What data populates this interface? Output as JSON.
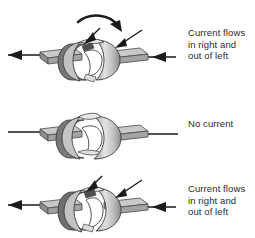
{
  "diagram": {
    "colors": {
      "ink": "#1a1a1a",
      "text": "#2b2b2b",
      "background": "#ffffff",
      "metal_light": "#d8d8d8",
      "metal_mid": "#b5b5b5",
      "metal_dark": "#8f8f8f",
      "metal_shadow": "#6e6e6e",
      "ring_dark": "#5c5c5c"
    },
    "panels": [
      {
        "id": "panel-top",
        "caption": "Current flows\nin right and\nout of left",
        "rotation_arrow": "clockwise-rotation-arrow",
        "rotation_arrow_visible": true,
        "brush_arrows_visible": true,
        "left_lead_arrow": "left-pointing-arrow",
        "right_lead_arrow": "left-pointing-arrow",
        "commutator_state": "tilted-gap-front-left"
      },
      {
        "id": "panel-middle",
        "caption": "No current",
        "rotation_arrow": "none",
        "rotation_arrow_visible": false,
        "brush_arrows_visible": false,
        "left_lead_arrow": "none",
        "right_lead_arrow": "none",
        "commutator_state": "gap-vertical-aligned"
      },
      {
        "id": "panel-bottom",
        "caption": "Current flows\nin right and\nout of left",
        "rotation_arrow": "none",
        "rotation_arrow_visible": false,
        "brush_arrows_visible": true,
        "left_lead_arrow": "left-pointing-arrow",
        "right_lead_arrow": "left-pointing-arrow",
        "commutator_state": "tilted-gap-front-right"
      }
    ]
  }
}
